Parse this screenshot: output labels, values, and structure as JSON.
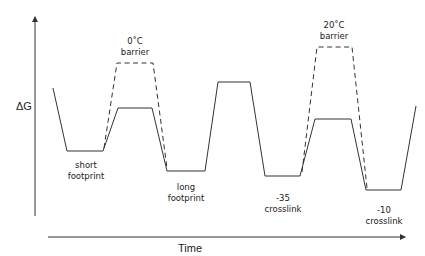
{
  "axes": {
    "y_label": "ΔG",
    "x_label": "Time"
  },
  "states": [
    {
      "line1": "short",
      "line2": "footprint"
    },
    {
      "line1": "long",
      "line2": "footprint"
    },
    {
      "line1": "-35",
      "line2": "crosslink"
    },
    {
      "line1": "-10",
      "line2": "crosslink"
    }
  ],
  "barriers": [
    {
      "line1": "0˚C",
      "line2": "barrier"
    },
    {
      "line1": "20˚C",
      "line2": "barrier"
    }
  ],
  "colors": {
    "line": "#333333",
    "background": "#ffffff"
  }
}
